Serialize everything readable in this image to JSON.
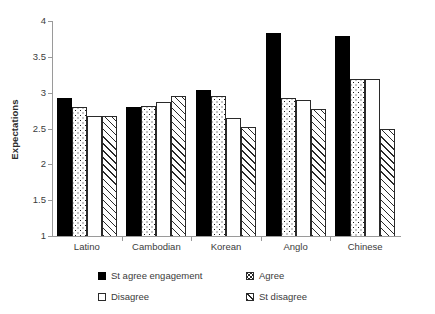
{
  "chart_data": {
    "type": "bar",
    "title": "",
    "xlabel": "",
    "ylabel": "Expectations",
    "ylim": [
      1,
      4
    ],
    "yticks": [
      "1",
      "1.5",
      "2",
      "2.5",
      "3",
      "3.5",
      "4"
    ],
    "grid": false,
    "legend_position": "bottom",
    "categories": [
      "Latino",
      "Cambodian",
      "Korean",
      "Anglo",
      "Chinese"
    ],
    "series": [
      {
        "name": "St agree engagement",
        "pattern": "solid-black",
        "values": [
          2.92,
          2.8,
          3.04,
          3.83,
          3.79
        ]
      },
      {
        "name": "Agree",
        "pattern": "dotted",
        "values": [
          2.8,
          2.81,
          2.96,
          2.92,
          3.19
        ]
      },
      {
        "name": "Disagree",
        "pattern": "white",
        "values": [
          2.67,
          2.87,
          2.65,
          2.9,
          3.19
        ]
      },
      {
        "name": "St disagree",
        "pattern": "diagonal-hatch",
        "values": [
          2.67,
          2.96,
          2.52,
          2.77,
          2.5
        ]
      }
    ]
  },
  "axis": {
    "y_title": "Expectations",
    "y_ticks": [
      "4",
      "3.5",
      "3",
      "2.5",
      "2",
      "1.5",
      "1"
    ],
    "x_ticks": [
      "Latino",
      "Cambodian",
      "Korean",
      "Anglo",
      "Chinese"
    ]
  },
  "legend": {
    "entries": [
      {
        "label": "St agree engagement",
        "swatch": "solid-black-swatch"
      },
      {
        "label": "Agree",
        "swatch": "dotted-swatch"
      },
      {
        "label": "Disagree",
        "swatch": "white-swatch"
      },
      {
        "label": "St disagree",
        "swatch": "hatched-swatch"
      }
    ]
  },
  "colors": {
    "series_solid": "#000000",
    "axis": "#9a9a9a",
    "text": "#3b3b3b",
    "background": "#ffffff"
  }
}
